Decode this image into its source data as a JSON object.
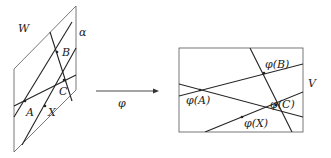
{
  "diagram": {
    "left_plane": {
      "label": "W",
      "line_label": "α",
      "points": [
        {
          "name": "A",
          "label": "A"
        },
        {
          "name": "B",
          "label": "B"
        },
        {
          "name": "C",
          "label": "C"
        },
        {
          "name": "X",
          "label": "X"
        }
      ]
    },
    "map": {
      "label": "φ"
    },
    "right_plane": {
      "label": "V",
      "points": [
        {
          "name": "phi-A",
          "label": "φ(A)"
        },
        {
          "name": "phi-B",
          "label": "φ(B)"
        },
        {
          "name": "phi-C",
          "label": "φ(C)"
        },
        {
          "name": "phi-X",
          "label": "φ(X)"
        }
      ]
    },
    "colors": {
      "lines": "#222222",
      "frame": "#555555",
      "background": "#ffffff"
    }
  }
}
